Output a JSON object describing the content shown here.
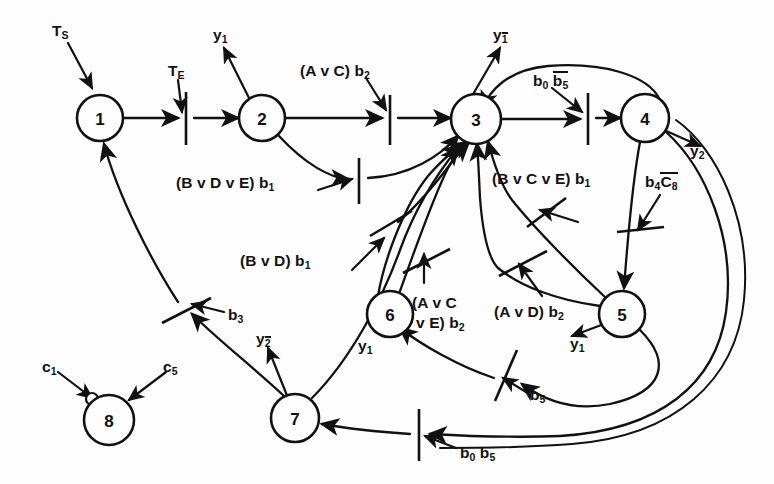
{
  "diagram": {
    "background_color": "#fdfdfd",
    "ink_color": "#111111",
    "nodes": [
      {
        "id": "1",
        "label": "1",
        "cx": 100,
        "cy": 118,
        "r": 23,
        "bubble": false
      },
      {
        "id": "2",
        "label": "2",
        "cx": 262,
        "cy": 118,
        "r": 23,
        "bubble": false
      },
      {
        "id": "3",
        "label": "3",
        "cx": 476,
        "cy": 119,
        "r": 25,
        "bubble": false
      },
      {
        "id": "4",
        "label": "4",
        "cx": 645,
        "cy": 118,
        "r": 24,
        "bubble": false
      },
      {
        "id": "5",
        "label": "5",
        "cx": 622,
        "cy": 314,
        "r": 23,
        "bubble": false
      },
      {
        "id": "6",
        "label": "6",
        "cx": 390,
        "cy": 314,
        "r": 23,
        "bubble": false
      },
      {
        "id": "7",
        "label": "7",
        "cx": 295,
        "cy": 418,
        "r": 24,
        "bubble": false
      },
      {
        "id": "8",
        "label": "8",
        "cx": 109,
        "cy": 420,
        "r": 25,
        "bubble": true
      }
    ],
    "labels": [
      {
        "name": "label-ts",
        "text_html": "T<sub>S</sub>",
        "x": 52,
        "y": 22
      },
      {
        "name": "label-te",
        "text_html": "T<sub>E</sub>",
        "x": 168,
        "y": 62
      },
      {
        "name": "label-y1-node2",
        "text_html": "y<sub>1</sub>",
        "x": 213,
        "y": 26
      },
      {
        "name": "label-avc-b2",
        "text_html": "(A v C) b<sub>2</sub>",
        "x": 300,
        "y": 62
      },
      {
        "name": "label-y1bar-node3",
        "text_html": "y<span class='ovsub'>1</span>",
        "x": 493,
        "y": 26
      },
      {
        "name": "label-b0-b5bar",
        "text_html": "b<sub>0</sub> <span class='ov'>b<sub>5</sub></span>",
        "x": 533,
        "y": 71
      },
      {
        "name": "label-y2-node4",
        "text_html": "y<sub>2</sub>",
        "x": 690,
        "y": 142
      },
      {
        "name": "label-bvdve-b1",
        "text_html": "(B v D v E) b<sub>1</sub>",
        "x": 176,
        "y": 174
      },
      {
        "name": "label-bvcve-b1",
        "text_html": "(B v C v E) b<sub>1</sub>",
        "x": 492,
        "y": 170
      },
      {
        "name": "label-b4-c8bar",
        "text_html": "b<sub>4</sub><span class='ov'>C<sub>8</sub></span>",
        "x": 645,
        "y": 172
      },
      {
        "name": "label-bvd-b1",
        "text_html": "(B v D) b<sub>1</sub>",
        "x": 240,
        "y": 252
      },
      {
        "name": "label-avc-ve-b2-l1",
        "text_html": "(A v C",
        "x": 412,
        "y": 294
      },
      {
        "name": "label-avc-ve-b2-l2",
        "text_html": "v E) b<sub>2</sub>",
        "x": 416,
        "y": 314
      },
      {
        "name": "label-avd-b2",
        "text_html": "(A v D) b<sub>2</sub>",
        "x": 494,
        "y": 303
      },
      {
        "name": "label-y1-node6",
        "text_html": "y<sub>1</sub>",
        "x": 358,
        "y": 337
      },
      {
        "name": "label-y1-node5",
        "text_html": "y<sub>1</sub>",
        "x": 570,
        "y": 335
      },
      {
        "name": "label-b3",
        "text_html": "b<sub>3</sub>",
        "x": 228,
        "y": 306
      },
      {
        "name": "label-y2bar-node7",
        "text_html": "y<span class='ovsub'>2</span>",
        "x": 256,
        "y": 330
      },
      {
        "name": "label-c1",
        "text_html": "c<sub>1</sub>",
        "x": 42,
        "y": 358
      },
      {
        "name": "label-c5",
        "text_html": "c<sub>5</sub>",
        "x": 163,
        "y": 358
      },
      {
        "name": "label-b5",
        "text_html": "b<sub>5</sub>",
        "x": 530,
        "y": 386
      },
      {
        "name": "label-b0-b5",
        "text_html": "b<sub>0</sub> b<sub>5</sub>",
        "x": 460,
        "y": 444
      }
    ],
    "transition_bars": [
      {
        "name": "bar-te",
        "x1": 186,
        "y1": 92,
        "x2": 186,
        "y2": 145
      },
      {
        "name": "bar-avc-b2",
        "x1": 390,
        "y1": 95,
        "x2": 390,
        "y2": 145
      },
      {
        "name": "bar-b0-b5bar",
        "x1": 588,
        "y1": 93,
        "x2": 588,
        "y2": 145
      },
      {
        "name": "bar-bvdve-b1",
        "x1": 359,
        "y1": 158,
        "x2": 359,
        "y2": 204
      },
      {
        "name": "bar-bvcve-b1",
        "x1": 527,
        "y1": 227,
        "x2": 566,
        "y2": 198
      },
      {
        "name": "bar-b4-c8bar",
        "x1": 617,
        "y1": 232,
        "x2": 662,
        "y2": 226
      },
      {
        "name": "bar-bvd-b1",
        "x1": 370,
        "y1": 235,
        "x2": 410,
        "y2": 212
      },
      {
        "name": "bar-avc-b2b",
        "x1": 404,
        "y1": 272,
        "x2": 449,
        "y2": 250
      },
      {
        "name": "bar-avd-b2",
        "x1": 500,
        "y1": 275,
        "x2": 546,
        "y2": 252
      },
      {
        "name": "bar-b3",
        "x1": 163,
        "y1": 322,
        "x2": 210,
        "y2": 299
      },
      {
        "name": "bar-b5",
        "x1": 497,
        "y1": 400,
        "x2": 516,
        "y2": 351
      },
      {
        "name": "bar-b0-b5",
        "x1": 419,
        "y1": 409,
        "x2": 419,
        "y2": 461
      }
    ]
  }
}
